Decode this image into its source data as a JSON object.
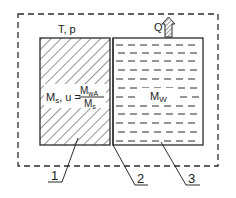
{
  "diagram": {
    "system_label": "T, p",
    "heat_label": "Q",
    "solid_region": {
      "mass_label": "M",
      "mass_sub": "s",
      "moisture_prefix": ", u =",
      "fraction_num": "M",
      "fraction_num_sub": "wA",
      "fraction_den": "M",
      "fraction_den_sub": "s"
    },
    "liquid_region": {
      "mass_label": "M",
      "mass_sub": "W"
    },
    "callouts": [
      {
        "label": "1"
      },
      {
        "label": "2"
      },
      {
        "label": "3"
      }
    ],
    "colors": {
      "line": "#2a2a2a",
      "background": "#ffffff"
    }
  }
}
